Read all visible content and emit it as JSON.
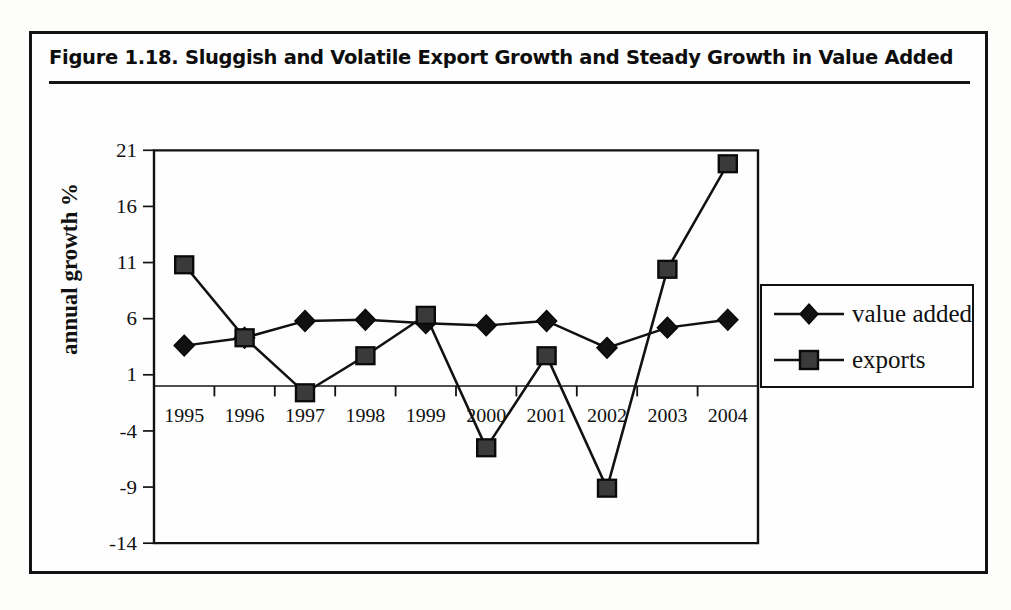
{
  "figure": {
    "title": "Figure 1.18.  Sluggish and Volatile Export Growth and Steady Growth in Value Added",
    "title_rule": true
  },
  "legend": {
    "position": "right",
    "items": [
      {
        "label": "value added",
        "marker": "diamond",
        "marker_name": "diamond-marker-icon"
      },
      {
        "label": "exports",
        "marker": "square",
        "marker_name": "square-marker-icon"
      }
    ]
  },
  "axes": {
    "ylabel": "annual growth %",
    "xlabel": "",
    "yticks": [
      "21",
      "16",
      "11",
      "6",
      "1",
      "-4",
      "-9",
      "-14"
    ],
    "xticks": [
      "1995",
      "1996",
      "1997",
      "1998",
      "1999",
      "2000",
      "2001",
      "2002",
      "2003",
      "2004"
    ]
  },
  "chart_data": {
    "type": "line",
    "title": "Figure 1.18.  Sluggish and Volatile Export Growth and Steady Growth in Value Added",
    "xlabel": "",
    "ylabel": "annual growth %",
    "categories": [
      "1995",
      "1996",
      "1997",
      "1998",
      "1999",
      "2000",
      "2001",
      "2002",
      "2003",
      "2004"
    ],
    "x": [
      1995,
      1996,
      1997,
      1998,
      1999,
      2000,
      2001,
      2002,
      2003,
      2004
    ],
    "series": [
      {
        "name": "value added",
        "marker": "diamond",
        "values": [
          3.6,
          4.3,
          5.8,
          5.9,
          5.6,
          5.4,
          5.8,
          3.4,
          5.2,
          5.9
        ]
      },
      {
        "name": "exports",
        "marker": "square",
        "values": [
          10.8,
          4.3,
          -0.6,
          2.7,
          6.3,
          -5.5,
          2.7,
          -9.1,
          10.4,
          19.8
        ]
      }
    ],
    "ylim": [
      -14,
      21
    ],
    "ytick_values": [
      21,
      16,
      11,
      6,
      1,
      -4,
      -9,
      -14
    ],
    "grid": false,
    "zero_line": true,
    "legend_position": "right",
    "line_color": "#111111",
    "marker_fill": "#3a3a3a"
  },
  "colors": {
    "ink": "#111111",
    "paper": "#fefefe",
    "marker_fill": "#3a3a3a"
  }
}
